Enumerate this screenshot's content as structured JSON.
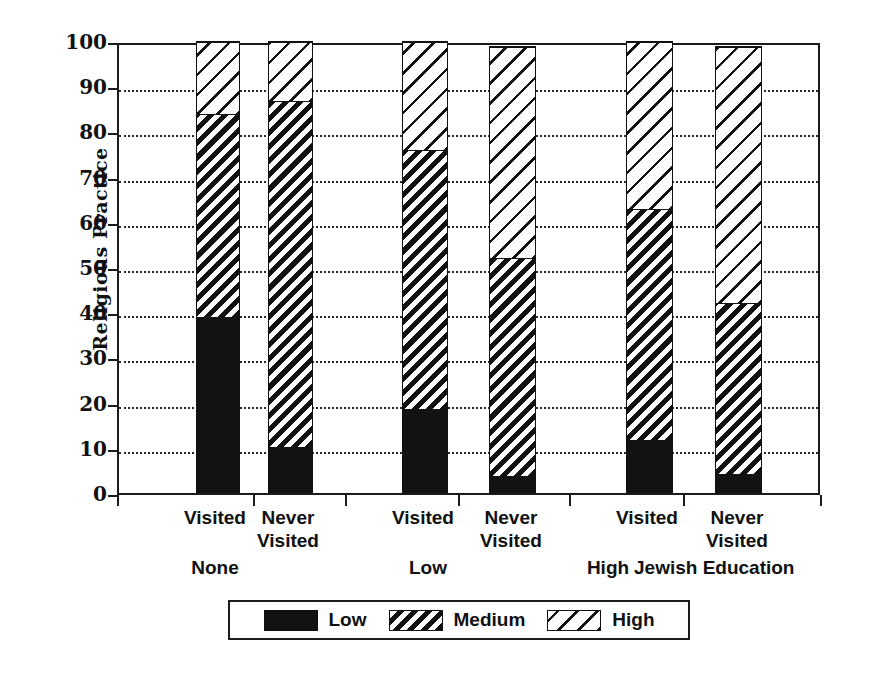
{
  "chart_data": {
    "type": "bar",
    "subtype": "stacked-bar-grouped",
    "title": "",
    "xlabel": "Jewish Education",
    "ylabel": "Religious Practice",
    "ylim": [
      0,
      100
    ],
    "ytick_labels": [
      "0",
      "10",
      "20",
      "30",
      "40",
      "50",
      "60",
      "70",
      "80",
      "90",
      "100"
    ],
    "ytick_values": [
      0,
      10,
      20,
      30,
      40,
      50,
      60,
      70,
      80,
      90,
      100
    ],
    "grid": "horizontal-dotted",
    "legend_position": "bottom",
    "group_labels": [
      "None",
      "Low",
      "High"
    ],
    "categories": [
      "Visited",
      "Never\nVisited",
      "Visited",
      "Never\nVisited",
      "Visited",
      "Never\nVisited"
    ],
    "series": [
      {
        "name": "Low",
        "pattern": "solid-black",
        "values": [
          39,
          10,
          18.5,
          3.5,
          11.5,
          4
        ]
      },
      {
        "name": "Medium",
        "pattern": "dense-hatch",
        "values": [
          45,
          77,
          57.5,
          48.5,
          51.5,
          38
        ]
      },
      {
        "name": "High",
        "pattern": "sparse-hatch",
        "values": [
          16,
          13,
          24,
          47,
          37,
          57
        ]
      }
    ],
    "cumulative_tops": {
      "low": [
        39,
        10,
        18.5,
        3.5,
        11.5,
        4
      ],
      "medium": [
        84,
        87,
        76,
        52,
        63,
        42
      ],
      "high": [
        100,
        100,
        100,
        99,
        100,
        99
      ]
    },
    "bars": [
      {
        "group": "None",
        "category": "Visited",
        "low": 39,
        "medium": 45,
        "high": 16,
        "total": 100
      },
      {
        "group": "None",
        "category": "Never Visited",
        "low": 10,
        "medium": 77,
        "high": 13,
        "total": 100
      },
      {
        "group": "Low",
        "category": "Visited",
        "low": 18.5,
        "medium": 57.5,
        "high": 24,
        "total": 100
      },
      {
        "group": "Low",
        "category": "Never Visited",
        "low": 3.5,
        "medium": 48.5,
        "high": 47,
        "total": 99
      },
      {
        "group": "High",
        "category": "Visited",
        "low": 11.5,
        "medium": 51.5,
        "high": 37,
        "total": 100
      },
      {
        "group": "High",
        "category": "Never Visited",
        "low": 4,
        "medium": 38,
        "high": 57,
        "total": 99
      }
    ]
  },
  "axis": {
    "y_title": "Religious Practice",
    "x_title": "Jewish Education",
    "ticks": [
      {
        "label": "100",
        "value": 100
      },
      {
        "label": "90",
        "value": 90
      },
      {
        "label": "80",
        "value": 80
      },
      {
        "label": "70",
        "value": 70
      },
      {
        "label": "60",
        "value": 60
      },
      {
        "label": "50",
        "value": 50
      },
      {
        "label": "40",
        "value": 40
      },
      {
        "label": "30",
        "value": 30
      },
      {
        "label": "20",
        "value": 20
      },
      {
        "label": "10",
        "value": 10
      },
      {
        "label": "0",
        "value": 0
      }
    ]
  },
  "xlabels": [
    {
      "text": "Visited",
      "center": 215
    },
    {
      "text": "Never\nVisited",
      "center": 288
    },
    {
      "text": "Visited",
      "center": 423
    },
    {
      "text": "Never\nVisited",
      "center": 511
    },
    {
      "text": "Visited",
      "center": 647
    },
    {
      "text": "Never\nVisited",
      "center": 737
    }
  ],
  "group_labels": [
    {
      "text": "None",
      "center": 215
    },
    {
      "text": "Low",
      "center": 428
    },
    {
      "text": "High",
      "center": 608
    }
  ],
  "legend": {
    "entries": [
      {
        "label": "Low",
        "pattern": "solid-black"
      },
      {
        "label": "Medium",
        "pattern": "dense-hatch"
      },
      {
        "label": "High",
        "pattern": "sparse-hatch"
      }
    ]
  },
  "colors": {
    "ink": "#111111",
    "background": "#ffffff"
  }
}
